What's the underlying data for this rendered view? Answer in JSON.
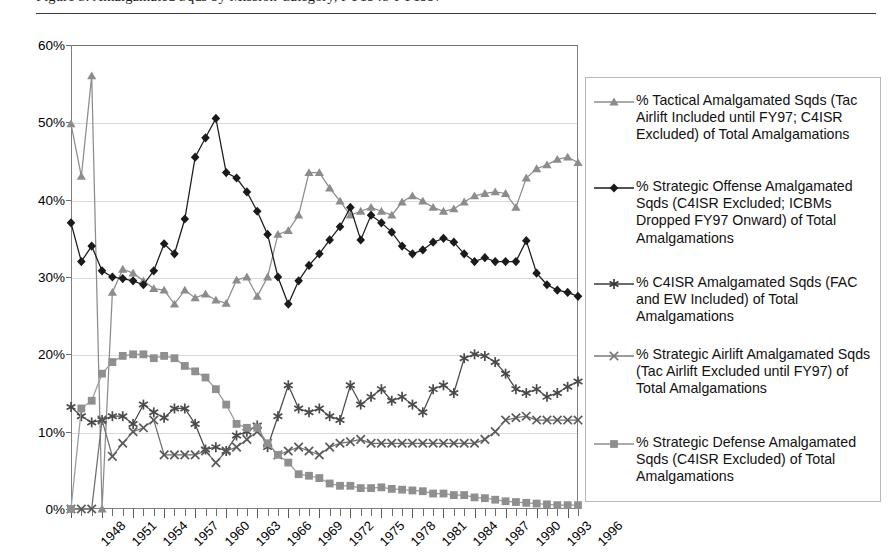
{
  "caption": {
    "text": "Figure 5: Amalgamated Sqds by Mission Category, FY1948-FY1997",
    "visible_note": "top line cropped - only descenders visible"
  },
  "chart_data": {
    "type": "line",
    "title": "",
    "xlabel": "",
    "ylabel": "",
    "ylim": [
      0,
      60
    ],
    "yunit": "%",
    "grid": true,
    "legend_position": "right",
    "ytick_labels": [
      "0%",
      "10%",
      "20%",
      "30%",
      "40%",
      "50%",
      "60%"
    ],
    "ytick_values": [
      0,
      10,
      20,
      30,
      40,
      50,
      60
    ],
    "xtick_labels": [
      "1948",
      "1951",
      "1954",
      "1957",
      "1960",
      "1963",
      "1966",
      "1969",
      "1972",
      "1975",
      "1978",
      "1981",
      "1984",
      "1987",
      "1990",
      "1993",
      "1996"
    ],
    "x_start": 1948,
    "x_end": 1997,
    "x": [
      1948,
      1949,
      1950,
      1951,
      1952,
      1953,
      1954,
      1955,
      1956,
      1957,
      1958,
      1959,
      1960,
      1961,
      1962,
      1963,
      1964,
      1965,
      1966,
      1967,
      1968,
      1969,
      1970,
      1971,
      1972,
      1973,
      1974,
      1975,
      1976,
      1977,
      1978,
      1979,
      1980,
      1981,
      1982,
      1983,
      1984,
      1985,
      1986,
      1987,
      1988,
      1989,
      1990,
      1991,
      1992,
      1993,
      1994,
      1995,
      1996,
      1997
    ],
    "series": [
      {
        "name": "% Tactical Amalgamated Sqds (Tac Airlift Included until FY97; C4ISR Excluded) of Total Amalgamations",
        "marker": "triangle",
        "color": "#8c8c8c",
        "line_color": "#8c8c8c",
        "values": [
          49.8,
          43.0,
          56.0,
          0.0,
          28.0,
          31.0,
          30.5,
          29.5,
          28.5,
          28.3,
          26.5,
          28.3,
          27.3,
          27.8,
          27.0,
          26.6,
          29.6,
          30.0,
          27.5,
          30.0,
          35.5,
          36.0,
          38.0,
          43.5,
          43.5,
          41.5,
          39.8,
          38.0,
          38.5,
          39.0,
          38.5,
          38.0,
          39.7,
          40.5,
          39.8,
          39.0,
          38.5,
          38.8,
          39.7,
          40.5,
          40.8,
          41.0,
          40.8,
          39.0,
          42.8,
          44.0,
          44.5,
          45.2,
          45.5,
          44.8
        ]
      },
      {
        "name": "% Strategic Offense Amalgamated Sqds (C4ISR Excluded; ICBMs Dropped FY97 Onward) of Total Amalgamations",
        "marker": "diamond",
        "color": "#1a1a1a",
        "line_color": "#1a1a1a",
        "values": [
          37.0,
          32.0,
          34.0,
          30.8,
          30.0,
          29.8,
          29.5,
          29.0,
          30.8,
          34.3,
          33.0,
          37.5,
          45.5,
          48.0,
          50.5,
          43.5,
          42.8,
          41.0,
          38.5,
          35.5,
          30.0,
          26.5,
          29.5,
          31.5,
          33.0,
          34.8,
          36.5,
          39.0,
          34.8,
          38.0,
          37.0,
          35.8,
          34.0,
          33.0,
          33.5,
          34.5,
          35.0,
          34.5,
          33.0,
          32.0,
          32.5,
          32.0,
          32.0,
          32.0,
          34.7,
          30.5,
          29.0,
          28.3,
          28.0,
          27.5
        ]
      },
      {
        "name": "% C4ISR Amalgamated Sqds (FAC and EW Included) of Total Amalgamations",
        "marker": "asterisk",
        "color": "#4a4a4a",
        "line_color": "#4a4a4a",
        "values": [
          13.2,
          12.0,
          11.2,
          11.5,
          12.0,
          12.0,
          11.0,
          13.5,
          12.5,
          11.8,
          13.0,
          13.0,
          11.0,
          7.7,
          8.0,
          7.5,
          9.5,
          10.0,
          10.8,
          8.0,
          12.0,
          16.0,
          13.0,
          12.5,
          13.0,
          12.0,
          11.5,
          16.0,
          13.5,
          14.5,
          15.5,
          14.0,
          14.5,
          13.5,
          12.5,
          15.5,
          16.0,
          15.0,
          19.5,
          20.0,
          19.8,
          19.0,
          17.5,
          15.5,
          15.0,
          15.5,
          14.5,
          15.0,
          15.8,
          16.5
        ]
      },
      {
        "name": "% Strategic Airlift Amalgamated Sqds (Tac Airlift Excluded until FY97) of Total Amalgamations",
        "marker": "x",
        "color": "#5a5a5a",
        "line_color": "#6e6e6e",
        "values": [
          0.0,
          0.0,
          0.0,
          11.5,
          6.8,
          8.5,
          10.0,
          10.5,
          11.5,
          7.0,
          7.0,
          7.0,
          7.0,
          7.5,
          6.0,
          7.5,
          8.0,
          9.0,
          10.0,
          8.5,
          7.0,
          7.5,
          8.0,
          7.5,
          7.0,
          8.0,
          8.5,
          8.7,
          9.0,
          8.5,
          8.5,
          8.5,
          8.5,
          8.5,
          8.5,
          8.5,
          8.5,
          8.5,
          8.5,
          8.5,
          9.0,
          10.0,
          11.5,
          11.8,
          12.0,
          11.5,
          11.5,
          11.5,
          11.5,
          11.5
        ]
      },
      {
        "name": "% Strategic Defense Amalgamated Sqds (C4ISR Excluded) of Total Amalgamations",
        "marker": "square",
        "color": "#8f8f8f",
        "line_color": "#9a9a9a",
        "values": [
          0.0,
          13.0,
          14.0,
          17.5,
          19.0,
          19.8,
          20.0,
          20.0,
          19.5,
          19.8,
          19.5,
          18.5,
          17.8,
          17.0,
          15.5,
          13.5,
          11.0,
          10.5,
          10.5,
          8.5,
          7.0,
          6.0,
          4.5,
          4.3,
          4.0,
          3.3,
          3.0,
          3.0,
          2.7,
          2.7,
          2.8,
          2.6,
          2.5,
          2.4,
          2.3,
          2.0,
          2.0,
          1.8,
          1.8,
          1.5,
          1.4,
          1.2,
          1.0,
          0.9,
          0.8,
          0.7,
          0.6,
          0.5,
          0.5,
          0.5
        ]
      }
    ]
  },
  "legend": {
    "items": [
      {
        "label": "% Tactical Amalgamated Sqds (Tac Airlift Included until FY97; C4ISR Excluded) of Total Amalgamations",
        "marker": "triangle",
        "color": "#8c8c8c"
      },
      {
        "label": "% Strategic Offense Amalgamated Sqds (C4ISR Excluded; ICBMs Dropped FY97 Onward) of Total Amalgamations",
        "marker": "diamond",
        "color": "#1a1a1a"
      },
      {
        "label": "% C4ISR Amalgamated Sqds (FAC and EW Included) of Total Amalgamations",
        "marker": "asterisk",
        "color": "#3a3a3a"
      },
      {
        "label": "% Strategic Airlift Amalgamated Sqds (Tac Airlift Excluded until FY97) of Total Amalgamations",
        "marker": "x",
        "color": "#7a7a7a"
      },
      {
        "label": "% Strategic Defense Amalgamated Sqds (C4ISR Excluded) of Total Amalgamations",
        "marker": "square",
        "color": "#8f8f8f"
      }
    ]
  }
}
